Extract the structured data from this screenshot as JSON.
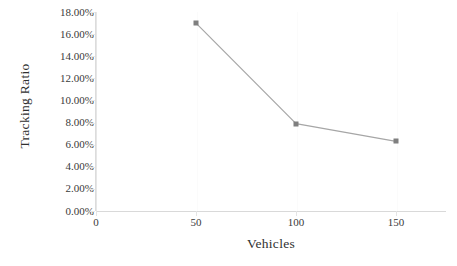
{
  "chart_data": {
    "type": "line",
    "title": "",
    "xlabel": "Vehicles",
    "ylabel": "Tracking Ratio",
    "x": [
      50,
      100,
      150
    ],
    "values": [
      17.0,
      7.9,
      6.3
    ],
    "series": [
      {
        "name": "Tracking Ratio",
        "values": [
          17.0,
          7.9,
          6.3
        ],
        "color": "#a6a6a6",
        "marker": "square",
        "marker_color": "#7f7f7f"
      }
    ],
    "xlim": [
      0,
      175
    ],
    "ylim": [
      0,
      18
    ],
    "x_ticks": [
      0,
      50,
      100,
      150
    ],
    "x_ticklabels": [
      "0",
      "50",
      "100",
      "150"
    ],
    "y_ticks": [
      0,
      2,
      4,
      6,
      8,
      10,
      12,
      14,
      16,
      18
    ],
    "y_ticklabels": [
      "0.00%",
      "2.00%",
      "4.00%",
      "6.00%",
      "8.00%",
      "10.00%",
      "12.00%",
      "14.00%",
      "16.00%",
      "18.00%"
    ],
    "grid": false,
    "legend": false,
    "legend_position": "none",
    "background": "#ffffff"
  }
}
